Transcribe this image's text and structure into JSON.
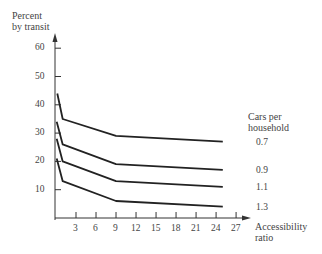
{
  "chart_data": {
    "type": "line",
    "title": "",
    "ylabel": "Percent by transit",
    "xlabel": "Accessibility ratio",
    "ylim": [
      0,
      65
    ],
    "xlim": [
      0,
      28
    ],
    "yticks": [
      "10",
      "20",
      "30",
      "40",
      "50",
      "60"
    ],
    "xticks": [
      "3",
      "6",
      "9",
      "12",
      "15",
      "18",
      "21",
      "24",
      "27"
    ],
    "grid": false,
    "legend_title": "Cars per household",
    "legend_position": "right, labels at line ends",
    "series": [
      {
        "name": "0.7",
        "x": [
          0.2,
          1,
          9,
          25
        ],
        "y": [
          44,
          35,
          29,
          27
        ]
      },
      {
        "name": "0.9",
        "x": [
          0.1,
          1,
          9,
          25
        ],
        "y": [
          34,
          26,
          19,
          17
        ]
      },
      {
        "name": "1.1",
        "x": [
          0.1,
          1,
          9,
          25
        ],
        "y": [
          28,
          20,
          13,
          11
        ]
      },
      {
        "name": "1.3",
        "x": [
          0.1,
          1,
          9,
          25
        ],
        "y": [
          21,
          13,
          6,
          4
        ]
      }
    ]
  },
  "labels": {
    "ylabel_line1": "Percent",
    "ylabel_line2": "by transit",
    "xlabel_line1": "Accessibility",
    "xlabel_line2": "ratio",
    "legend_line1": "Cars per",
    "legend_line2": "household"
  }
}
